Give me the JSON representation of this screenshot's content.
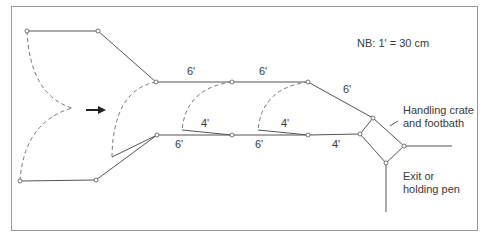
{
  "note": "NB: 1' = 30 cm",
  "dimensions": {
    "top_rail_1": "6'",
    "top_rail_2": "6'",
    "top_diagonal": "6'",
    "gate_1": "4'",
    "gate_2": "4'",
    "bottom_rail_1": "6'",
    "bottom_rail_2": "6'",
    "bottom_rail_3": "4'"
  },
  "labels": {
    "crate_line1": "Handling crate",
    "crate_line2": "and footbath",
    "exit_line1": "Exit or",
    "exit_line2": "holding pen"
  },
  "colors": {
    "line": "#555555",
    "dashed": "#777777",
    "frame": "#9a9a9a",
    "arrow": "#222222"
  },
  "arrow": "flow-direction-right"
}
